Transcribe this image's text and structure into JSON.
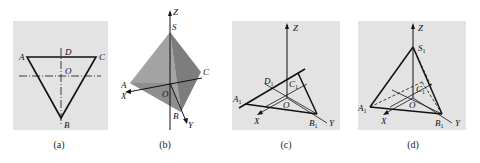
{
  "figure": {
    "panels": [
      {
        "id": "a",
        "caption": "(a)",
        "description": "Inverted equilateral triangle ABC in top view with center O and dash-dot center lines",
        "labels": {
          "A": "A",
          "B": "B",
          "C": "C",
          "D": "D",
          "O": "O"
        }
      },
      {
        "id": "b",
        "caption": "(b)",
        "description": "Shaded tetrahedron S-ABC on coordinate axes X, Y, Z with origin O",
        "labels": {
          "Z": "Z",
          "S": "S",
          "A": "A",
          "C": "C",
          "X": "X",
          "O": "O",
          "B": "B",
          "Y": "Y"
        }
      },
      {
        "id": "c",
        "caption": "(c)",
        "description": "Axonometric base triangle A1B1C1 with points D1 and O on X, Y, Z axes",
        "labels": {
          "Z": "Z",
          "D": "D",
          "C": "C",
          "A": "A",
          "O": "O",
          "X": "X",
          "B": "B",
          "Y": "Y",
          "sub": "1"
        }
      },
      {
        "id": "d",
        "caption": "(d)",
        "description": "Axonometric tetrahedron S1-A1B1C1 with hidden edges dashed",
        "labels": {
          "Z": "Z",
          "S": "S",
          "C": "C",
          "A": "A",
          "O": "O",
          "X": "X",
          "B": "B",
          "Y": "Y",
          "sub": "1"
        }
      }
    ]
  },
  "colors": {
    "background": "#e3e3e3",
    "line": "#111111",
    "face_light": "#9a9a9a",
    "face_dark": "#7a7a7a"
  }
}
